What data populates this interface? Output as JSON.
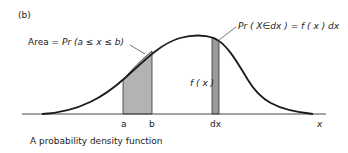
{
  "figure": {
    "panel_label": "(b)",
    "caption": "A probability density function",
    "colors": {
      "background": "#ffffff",
      "curve": "#1a1a1a",
      "shade": "#b3b3b3",
      "strip": "#9a9a9a",
      "text": "#222222"
    }
  },
  "annotations": {
    "area_label": {
      "prefix": "Area = ",
      "expr": "Pr (a ≤ x ≤ b)"
    },
    "strip_label": {
      "expr": "Pr ( X∈dx ) = f ( x ) dx"
    },
    "height_label": "f ( x )"
  },
  "axis": {
    "ticks": [
      {
        "label": "a"
      },
      {
        "label": "b"
      },
      {
        "label": "dx"
      }
    ],
    "x_label": "x"
  }
}
